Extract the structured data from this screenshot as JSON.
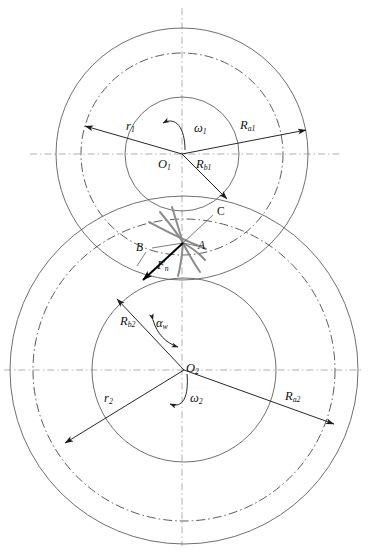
{
  "figure": {
    "type": "engineering-diagram",
    "background_color": "#ffffff",
    "width": 369,
    "height": 554
  },
  "colors": {
    "circle_stroke": "#606060",
    "pitch_circle_stroke": "#4a4a4a",
    "axis_stroke": "#9b9b9b",
    "dimension_stroke": "#1c1c1c",
    "tooth_profile_stroke": "#8c8c8c",
    "force_vector_stroke": "#000000",
    "label_color": "#111111"
  },
  "gear1": {
    "name": "driving-gear",
    "center_label": "O",
    "center_sub": "1",
    "center_x": 182,
    "center_y": 154,
    "addendum_radius_px": 126,
    "pitch_radius_px": 101,
    "base_radius_px": 57,
    "labels": {
      "pitch_radius": {
        "sym": "r",
        "sub": "1"
      },
      "addendum_radius": {
        "sym": "R",
        "sub": "a1"
      },
      "base_radius": {
        "sym": "R",
        "sub": "b1"
      },
      "angular_velocity": {
        "sym": "ω",
        "sub": "1"
      }
    }
  },
  "gear2": {
    "name": "driven-gear",
    "center_label": "O",
    "center_sub": "2",
    "center_x": 184,
    "center_y": 370,
    "addendum_radius_px": 174,
    "pitch_radius_px": 151,
    "base_radius_px": 92,
    "labels": {
      "pitch_radius": {
        "sym": "r",
        "sub": "2"
      },
      "addendum_radius": {
        "sym": "R",
        "sub": "a2"
      },
      "base_radius": {
        "sym": "R",
        "sub": "b2"
      },
      "angular_velocity": {
        "sym": "ω",
        "sub": "2"
      },
      "pressure_angle": {
        "sym": "α",
        "sub": "w"
      }
    }
  },
  "mesh": {
    "pitch_point_x": 182,
    "pitch_point_y": 243,
    "contact_points": [
      {
        "id": "point-A",
        "label": "A",
        "x": 200,
        "y": 248
      },
      {
        "id": "point-B",
        "label": "B",
        "x": 146,
        "y": 249
      },
      {
        "id": "point-C",
        "label": "C",
        "x": 215,
        "y": 212
      }
    ],
    "normal_force": {
      "sym": "F",
      "sub": "n"
    }
  },
  "axes": {
    "vertical_centerline_x": 182,
    "gear1_horizontal_y": 154,
    "gear2_horizontal_y": 370
  }
}
